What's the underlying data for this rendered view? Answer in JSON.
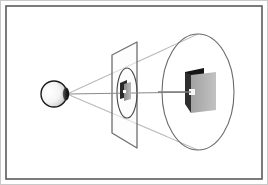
{
  "figure": {
    "description": "An eye at the left projects a cone of sight rays through a near image plane containing a small projected object, out to a large far ellipse containing the full-size object.",
    "canvas": {
      "width": 268,
      "height": 185
    },
    "background_color": "#ffffff"
  },
  "frame": {
    "outer": {
      "label": "outer frame",
      "color": "#c9c9c9",
      "stroke_width": 1,
      "x": 0,
      "y": 0,
      "width": 268,
      "height": 185
    },
    "inner": {
      "label": "inner frame",
      "color": "#5a5a5a",
      "stroke_width": 1.6,
      "x": 6,
      "y": 6,
      "width": 256,
      "height": 173
    }
  },
  "eye": {
    "label": "eye",
    "center_x": 54,
    "center_y": 94,
    "radius": 13,
    "outline_color": "#1a1a1a",
    "outline_width": 1.4,
    "fill_light": "#ffffff",
    "fill_mid": "#e8e8e8",
    "fill_dark": "#3a3a3a",
    "pupil_x": 66,
    "pupil_y": 94,
    "pupil_rx": 3.2,
    "pupil_ry": 6.5,
    "pupil_color": "#1c1c1c"
  },
  "apex": {
    "label": "projection center",
    "x": 67,
    "y": 94
  },
  "near_plane": {
    "label": "near image plane",
    "stroke_color": "#6e6e6e",
    "stroke_width": 1.3,
    "fill_color": "#fbfbfb",
    "fill_opacity": 0.55,
    "points": "112,55 137,42 137,148 112,133",
    "left_top_x": 112,
    "left_top_y": 55,
    "right_top_x": 137,
    "right_top_y": 42,
    "right_bottom_x": 137,
    "right_bottom_y": 148,
    "left_bottom_x": 112,
    "left_bottom_y": 133
  },
  "near_ellipse": {
    "label": "near cone cross-section",
    "cx": 127,
    "cy": 93,
    "rx": 10,
    "ry": 25,
    "stroke_color": "#4a4a4a",
    "stroke_width": 1.1,
    "fill": "none"
  },
  "far_ellipse": {
    "label": "far cone cross-section",
    "cx": 198,
    "cy": 92,
    "rx": 36,
    "ry": 58,
    "stroke_color": "#6a6a6a",
    "stroke_width": 1.1,
    "fill": "none"
  },
  "cone_rays": {
    "label": "sight cone rays",
    "stroke_color": "#b0b0b0",
    "stroke_width": 0.9,
    "lines": [
      {
        "name": "ray-top",
        "x1": 67,
        "y1": 94,
        "x2": 198,
        "y2": 34
      },
      {
        "name": "ray-bottom",
        "x1": 67,
        "y1": 94,
        "x2": 198,
        "y2": 150
      },
      {
        "name": "ray-upper-inner",
        "x1": 67,
        "y1": 94,
        "x2": 162,
        "y2": 60
      },
      {
        "name": "ray-lower-inner",
        "x1": 67,
        "y1": 94,
        "x2": 162,
        "y2": 128
      }
    ]
  },
  "axis_line": {
    "label": "optical axis",
    "x1": 67,
    "y1": 94,
    "x2": 200,
    "y2": 92,
    "stroke_color": "#8a8a8a",
    "stroke_width": 1.0
  },
  "near_object": {
    "label": "projected miniature object",
    "back_panel": {
      "name": "near-back-panel",
      "points": "120,83 127,80 127,97 120,99",
      "color": "#2a2a2a"
    },
    "front_panel": {
      "name": "near-front-panel",
      "points": "124,84 131,82 131,99 124,101",
      "color": "#9a9a9a"
    },
    "highlight": {
      "name": "near-highlight",
      "x": 124,
      "y": 90,
      "width": 3,
      "height": 3,
      "color": "#ffffff"
    }
  },
  "far_object": {
    "label": "full-size object",
    "dark_panel": {
      "name": "far-dark-panel",
      "points": "185,72 204,68 204,99 185,104",
      "color": "#151515"
    },
    "gray_panel": {
      "name": "far-gray-panel",
      "points": "191,75 216,72 216,110 191,113",
      "color": "#adadad"
    },
    "side_face": {
      "name": "far-side-face",
      "points": "185,72 191,75 191,113 185,104",
      "color": "#333333"
    },
    "highlight": {
      "name": "far-highlight",
      "x": 189,
      "y": 89,
      "width": 6,
      "height": 6,
      "color": "#f6f6f6"
    },
    "pointer": {
      "name": "far-pointer-line",
      "x1": 160,
      "y1": 92,
      "x2": 192,
      "y2": 92,
      "color": "#7d7d7d",
      "stroke_width": 1.6
    }
  },
  "colors": {
    "ink": "#1a1a1a",
    "frame": "#5a5a5a",
    "ray": "#b0b0b0",
    "panel_dark": "#151515",
    "panel_gray": "#adadad",
    "background": "#ffffff"
  }
}
